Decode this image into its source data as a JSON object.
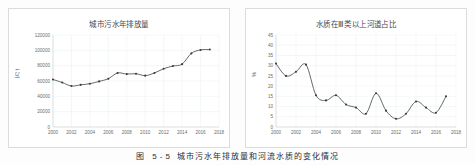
{
  "figure": {
    "caption_number": "图 5-5",
    "caption_text": "城市污水年排放量和河流水质的变化情况"
  },
  "panels": [
    {
      "id": "left",
      "title": "城市污水年排放量",
      "ylabel": "万 t"
    },
    {
      "id": "right",
      "title": "水质在Ⅲ类以上河道占比",
      "ylabel": "%"
    }
  ],
  "chart_data": [
    {
      "type": "line",
      "title": "城市污水年排放量",
      "xlabel": "",
      "ylabel": "万 t",
      "xlim": [
        2000,
        2018
      ],
      "ylim": [
        0,
        120000
      ],
      "xticks": [
        2000,
        2002,
        2004,
        2006,
        2008,
        2010,
        2012,
        2014,
        2016,
        2018
      ],
      "yticks": [
        0,
        20000,
        40000,
        60000,
        80000,
        100000,
        120000
      ],
      "xtick_labels": [
        "2000",
        "2002",
        "2004",
        "2006",
        "2008",
        "2010",
        "2012",
        "2014",
        "2016",
        "2018"
      ],
      "ytick_labels": [
        "0",
        "20000",
        "40000",
        "60000",
        "80000",
        "100000",
        "120000"
      ],
      "grid": true,
      "legend": "none",
      "markers": true,
      "x": [
        2000,
        2001,
        2002,
        2003,
        2004,
        2005,
        2006,
        2007,
        2008,
        2009,
        2010,
        2011,
        2012,
        2013,
        2014,
        2015,
        2016,
        2017
      ],
      "values": [
        62000,
        58000,
        53500,
        55000,
        56500,
        59500,
        63000,
        70500,
        69000,
        69500,
        67000,
        70500,
        76000,
        79500,
        82000,
        96000,
        100500,
        101000
      ]
    },
    {
      "type": "line",
      "title": "水质在Ⅲ类以上河道占比",
      "xlabel": "",
      "ylabel": "%",
      "xlim": [
        2000,
        2018
      ],
      "ylim": [
        0,
        45
      ],
      "xticks": [
        2000,
        2002,
        2004,
        2006,
        2008,
        2010,
        2012,
        2014,
        2016,
        2018
      ],
      "yticks": [
        0,
        5,
        10,
        15,
        20,
        25,
        30,
        35,
        40,
        45
      ],
      "xtick_labels": [
        "2000",
        "2002",
        "2004",
        "2006",
        "2008",
        "2010",
        "2012",
        "2014",
        "2016",
        "2018"
      ],
      "ytick_labels": [
        "0",
        "5",
        "10",
        "15",
        "20",
        "25",
        "30",
        "35",
        "40",
        "45"
      ],
      "grid": true,
      "legend": "none",
      "markers": true,
      "x": [
        2000,
        2001,
        2002,
        2003,
        2004,
        2005,
        2006,
        2007,
        2008,
        2009,
        2010,
        2011,
        2012,
        2013,
        2014,
        2015,
        2016,
        2017
      ],
      "values": [
        31,
        25,
        27,
        30.5,
        15.5,
        13,
        15.5,
        11,
        9.5,
        6.5,
        16.5,
        8,
        4,
        6.5,
        12.5,
        9.5,
        7,
        15
      ]
    }
  ],
  "colors": {
    "line": "#4d4d4d",
    "marker": "#3c3c3c",
    "grid": "#e6ecf2",
    "axis": "#c9c9c9",
    "panel_border": "#dcdcdc",
    "background": "#fdfdfd",
    "text": "#4a4a4a"
  }
}
